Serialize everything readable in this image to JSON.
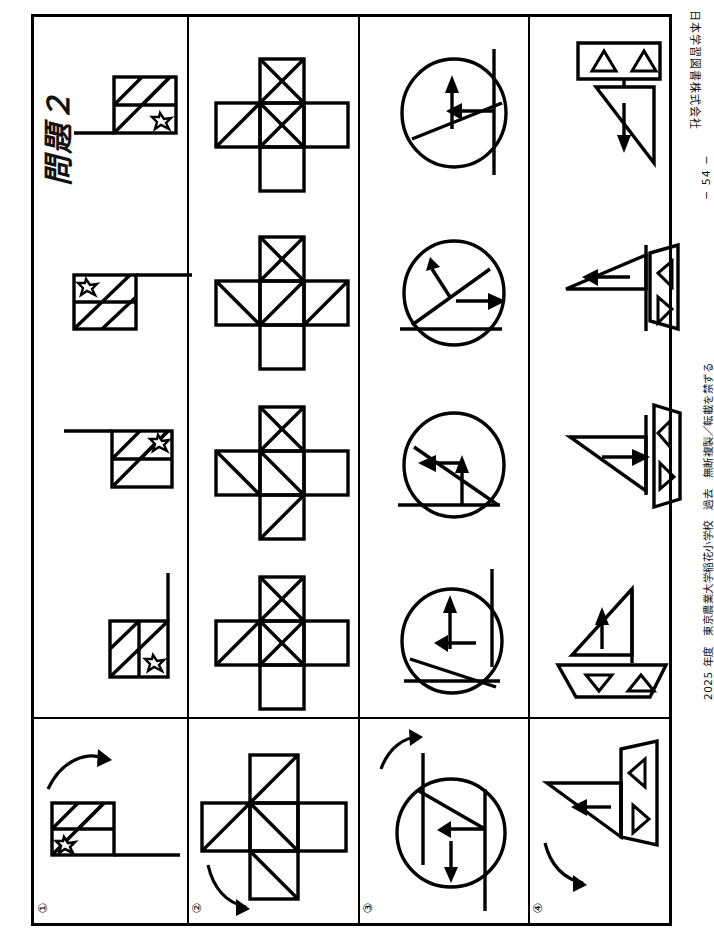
{
  "document": {
    "publisher": "日本学習図書株式会社",
    "copyright": "2025 年度　東京農業大学稲花小学校　過去　無断複製／転載を禁ずる",
    "page_number": "− 54 −",
    "masthead": "問題２",
    "orientation": "landscape-rotated-90",
    "page_width": 714,
    "page_height": 950
  },
  "colors": {
    "ink": "#000000",
    "paper": "#ffffff"
  },
  "grid": {
    "columns": 4,
    "answer_cells_per_row": 4,
    "question_cell_label": "question",
    "divider_note": "horizontal rule separates the question column (bottom) from the four answer columns (top)"
  },
  "rows": [
    {
      "number": "①",
      "figure_type": "rectangle-with-diagonals-and-star",
      "question": {
        "rotation_arrow": "clockwise-quarter-turn",
        "description": "横長の長方形に斜線と星、下に基線"
      },
      "options": [
        {
          "index": 1,
          "orientation": "baseline-right-vertical",
          "star_position": "bottom-right"
        },
        {
          "index": 2,
          "orientation": "baseline-right-horizontal-top",
          "star_position": "bottom-right"
        },
        {
          "index": 3,
          "orientation": "baseline-left-horizontal-top",
          "star_position": "top-left"
        },
        {
          "index": 4,
          "orientation": "baseline-right-horizontal-bottom",
          "star_position": "bottom-right"
        }
      ]
    },
    {
      "number": "②",
      "figure_type": "cross-plus-with-diagonals",
      "question": {
        "rotation_arrow": "counter-clockwise-quarter-turn",
        "description": "十字形に対角線"
      },
      "options": [
        {
          "index": 1,
          "variant": "A"
        },
        {
          "index": 2,
          "variant": "B"
        },
        {
          "index": 3,
          "variant": "C"
        },
        {
          "index": 4,
          "variant": "D"
        }
      ]
    },
    {
      "number": "③",
      "figure_type": "circle-with-chord-and-arrows",
      "question": {
        "rotation_arrow": "clockwise-quarter-turn",
        "description": "円に弦と矢印、外に縦線"
      },
      "options": [
        {
          "index": 1,
          "arrow_1": "up",
          "arrow_2": "left"
        },
        {
          "index": 2,
          "arrow_1": "left",
          "arrow_2": "up"
        },
        {
          "index": 3,
          "arrow_1": "up-left",
          "arrow_2": "right"
        },
        {
          "index": 4,
          "arrow_1": "up",
          "arrow_2": "left"
        }
      ]
    },
    {
      "number": "④",
      "figure_type": "sailboat-with-triangles",
      "question": {
        "rotation_arrow": "clockwise-quarter-turn",
        "description": "ヨット（帆と船体）に三角マーク"
      },
      "options": [
        {
          "index": 1,
          "hull": "bottom",
          "sail_arrow": "up",
          "hull_marks": [
            "triangle-down",
            "triangle-up"
          ]
        },
        {
          "index": 2,
          "hull": "left",
          "sail_arrow": "right",
          "hull_marks": [
            "triangle-left",
            "triangle-left"
          ]
        },
        {
          "index": 3,
          "hull": "right",
          "sail_arrow": "left",
          "hull_marks": [
            "triangle-right",
            "triangle-left"
          ]
        },
        {
          "index": 4,
          "hull": "top",
          "sail_arrow": "down",
          "hull_marks": [
            "triangle-up",
            "triangle-up"
          ]
        }
      ]
    }
  ]
}
